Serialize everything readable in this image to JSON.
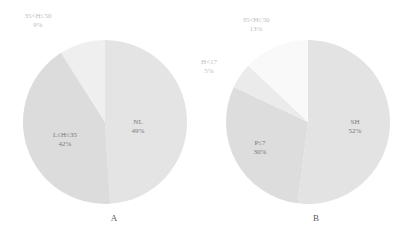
{
  "chart_data": [
    {
      "type": "pie",
      "title": "A",
      "center": [
        105,
        122
      ],
      "radius": 82,
      "slices": [
        {
          "label": "NL",
          "value": 49,
          "pct_text": "49%",
          "color": "#e4e4e4",
          "text_color": "#7a7a7a",
          "inside": true,
          "label_pos": [
            138,
            124
          ]
        },
        {
          "label": "L≤H≤35",
          "value": 42,
          "pct_text": "42%",
          "color": "#dcdcdc",
          "text_color": "#7a7a7a",
          "inside": true,
          "label_pos": [
            65,
            137
          ]
        },
        {
          "label": "35<H≤50",
          "value": 9,
          "pct_text": "9%",
          "color": "#efefef",
          "text_color": "#bdbdbd",
          "inside": false,
          "label_pos": [
            38,
            18
          ]
        }
      ]
    },
    {
      "type": "pie",
      "title": "B",
      "center": [
        308,
        122
      ],
      "radius": 82,
      "slices": [
        {
          "label": "SH",
          "value": 52,
          "pct_text": "52%",
          "color": "#e3e3e3",
          "text_color": "#7a7a7a",
          "inside": true,
          "label_pos": [
            355,
            124
          ]
        },
        {
          "label": "P≤7",
          "value": 30,
          "pct_text": "30%",
          "color": "#dddddd",
          "text_color": "#7a7a7a",
          "inside": true,
          "label_pos": [
            260,
            145
          ]
        },
        {
          "label": "H<17",
          "value": 5,
          "pct_text": "5%",
          "color": "#ebebeb",
          "text_color": "#bdbdbd",
          "inside": false,
          "label_pos": [
            209,
            64
          ]
        },
        {
          "label": "35<H≤50",
          "value": 13,
          "pct_text": "13%",
          "color": "#f9f9f9",
          "text_color": "#bdbdbd",
          "inside": false,
          "label_pos": [
            256,
            22
          ]
        }
      ]
    }
  ],
  "captions": {
    "a": {
      "text": "A",
      "pos": [
        114,
        221
      ]
    },
    "b": {
      "text": "B",
      "pos": [
        316,
        221
      ]
    }
  }
}
